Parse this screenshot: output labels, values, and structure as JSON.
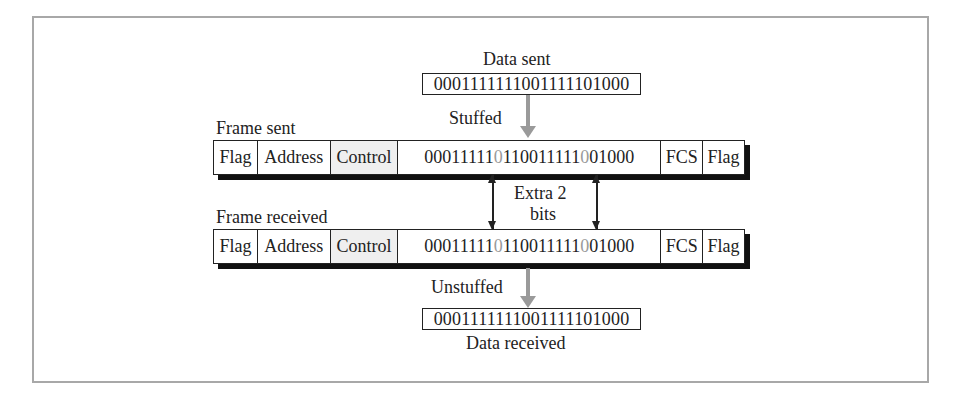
{
  "data_sent": {
    "label": "Data sent",
    "bits": "0001111111001111101000"
  },
  "stuffed_label": "Stuffed",
  "frame_sent": {
    "label": "Frame sent",
    "fields": [
      "Flag",
      "Address",
      "Control"
    ],
    "payload": {
      "seg1": "00011111",
      "stuffed1": "0",
      "seg2": "110011111",
      "stuffed2": "0",
      "seg3": "01000"
    },
    "trailer": [
      "FCS",
      "Flag"
    ]
  },
  "extra_bits_label": {
    "line1": "Extra 2",
    "line2": "bits"
  },
  "frame_received": {
    "label": "Frame received",
    "fields": [
      "Flag",
      "Address",
      "Control"
    ],
    "payload": {
      "seg1": "00011111",
      "stuffed1": "0",
      "seg2": "110011111",
      "stuffed2": "0",
      "seg3": "01000"
    },
    "trailer": [
      "FCS",
      "Flag"
    ]
  },
  "unstuffed_label": "Unstuffed",
  "data_received": {
    "label": "Data received",
    "bits": "0001111111001111101000"
  },
  "colors": {
    "stuffed_bit": "#9a9a9a",
    "control_fill": "#efefef",
    "border": "#222222",
    "outer_border": "#a8a8a8"
  }
}
